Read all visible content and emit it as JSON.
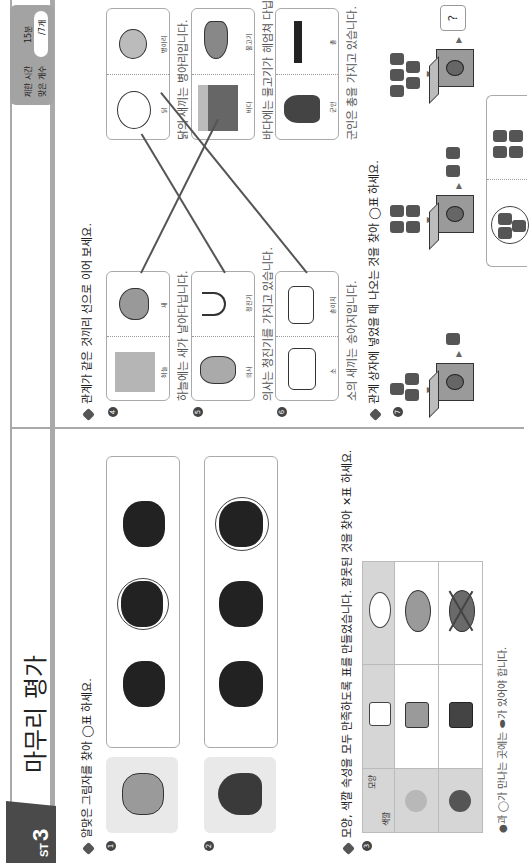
{
  "header": {
    "test_label": "ST",
    "test_number": "3",
    "title": "마무리 평가",
    "brand": "pensées",
    "timer": {
      "time_limit_label": "제한 시간",
      "time_limit_value": "15분",
      "correct_count_label": "맞은 개수",
      "correct_count_value": "/7개"
    }
  },
  "left_column": {
    "question_a": {
      "prompt": "알맞은 그림자를 찾아 ◯표 하세요.",
      "items": [
        {
          "number": "1",
          "subject": "pig-cat",
          "options": 3,
          "circled_index": 1
        },
        {
          "number": "2",
          "subject": "octopus",
          "options": 3,
          "circled_index": 2
        }
      ]
    },
    "question_b": {
      "prompt": "모양, 색깔 속성을 모두 만족하도록 표를 만들었습니다. 잘못된 것을 찾아 ✕표 하세요.",
      "number": "3",
      "table": {
        "corner_top": "모양",
        "corner_bottom": "색깔",
        "columns": [
          "bag",
          "plate"
        ],
        "rows": [
          "white",
          "light-gray",
          "dark-gray"
        ],
        "crossed_cell": "dark-gray-plate"
      },
      "hint": "●과 ◯가 만나는 곳에는 ⬬가 있어야 합니다."
    }
  },
  "right_column": {
    "question_c": {
      "prompt": "관계가 같은 것끼리 선으로 이어 보세요.",
      "items": [
        {
          "number": "4",
          "left_label": "하늘",
          "right_label": "새",
          "caption": "하늘에는 새가 날아다닙니다."
        },
        {
          "number": "5",
          "left_label": "의사",
          "right_label": "청진기",
          "caption": "의사는 청진기를 가지고 있습니다."
        },
        {
          "number": "6",
          "left_label": "소",
          "right_label": "송아지",
          "caption": "소의 새끼는 송아지입니다."
        }
      ],
      "targets": [
        {
          "left_label": "닭",
          "right_label": "병아리",
          "caption": "닭의 새끼는 병아리입니다."
        },
        {
          "left_label": "바다",
          "right_label": "물고기",
          "caption": "바다에는 물고기가 헤엄쳐 다닙니다."
        },
        {
          "left_label": "군인",
          "right_label": "총",
          "caption": "군인은 총을 가지고 있습니다."
        }
      ]
    },
    "question_d": {
      "prompt": "관계 상자에 넣었을 때 나오는 것을 찾아 ◯표 하세요.",
      "number": "7",
      "rows": [
        {
          "input": "3 cars",
          "output": "1 car"
        },
        {
          "input": "4 airplanes",
          "output": "2 airplanes"
        },
        {
          "input": "5 ships",
          "output": "?"
        }
      ],
      "unknown_label": "?",
      "answer_options": [
        "3 ships (circled)",
        "4 ships"
      ]
    }
  },
  "colors": {
    "band": "#a9a9a9",
    "tab": "#4a4a4a",
    "card_border": "#aaaaaa",
    "table_header": "#d6d6d6"
  }
}
